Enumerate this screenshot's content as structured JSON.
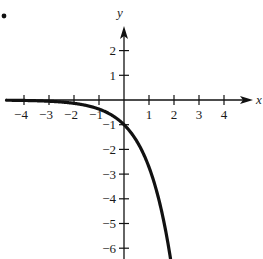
{
  "problem_marker": ".",
  "chart_data": {
    "type": "line",
    "title": "",
    "xlabel": "x",
    "ylabel": "y",
    "function": "y = -e^x",
    "xlim": [
      -4.6,
      5.1
    ],
    "ylim": [
      -6.5,
      2.8
    ],
    "grid": false,
    "legend": null,
    "x_ticks": [
      -4,
      -3,
      -2,
      -1,
      1,
      2,
      3,
      4
    ],
    "x_tick_labels": [
      "−4",
      "−3",
      "−2",
      "−1",
      "1",
      "2",
      "3",
      "4"
    ],
    "y_ticks": [
      2,
      1,
      -1,
      -2,
      -3,
      -4,
      -5,
      -6
    ],
    "y_tick_labels": [
      "2",
      "1",
      "−1",
      "−2",
      "−3",
      "−4",
      "−5",
      "−6"
    ],
    "series": [
      {
        "name": "y = -e^x",
        "x": [
          -4.6,
          -4,
          -3,
          -2,
          -1.5,
          -1,
          -0.5,
          0,
          0.5,
          1,
          1.5,
          1.85
        ],
        "y": [
          -0.01,
          -0.018,
          -0.05,
          -0.135,
          -0.223,
          -0.368,
          -0.607,
          -1.0,
          -1.649,
          -2.718,
          -4.482,
          -6.36
        ]
      }
    ]
  }
}
